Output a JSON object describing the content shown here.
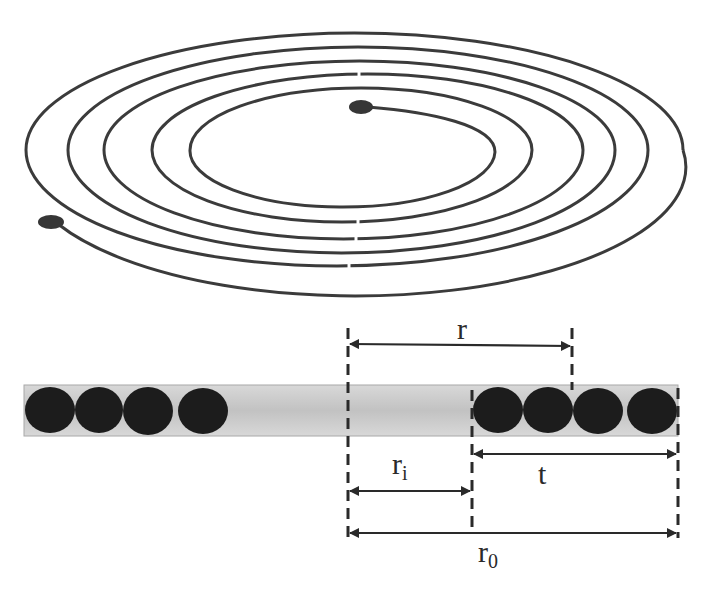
{
  "figure": {
    "type": "spiral-winding-diagram",
    "colors": {
      "stroke": "#3b3b3b",
      "dot": "#363636",
      "bar_fill_edge": "#d6d6d6",
      "bar_fill_center": "#c3c3c3",
      "bar_border": "#a8a8a8",
      "conductor": "#1c1c1c",
      "dimension_line": "#2a2a2a"
    },
    "spiral": {
      "turns": 5,
      "start_dot": "inner-terminal",
      "end_dot": "outer-terminal"
    },
    "cross_section": {
      "left_conductors": 4,
      "right_conductors": 4
    },
    "labels": {
      "r": "r",
      "t": "t",
      "ri_base": "r",
      "ri_sub": "i",
      "r0_base": "r",
      "r0_sub": "0"
    }
  }
}
